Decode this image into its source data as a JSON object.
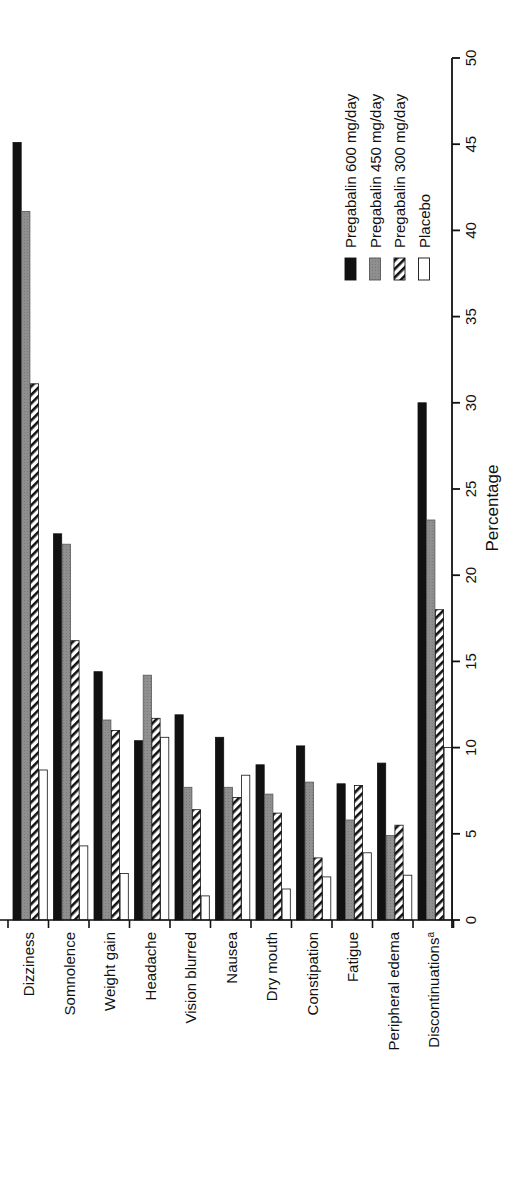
{
  "chart_data": {
    "type": "bar",
    "orientation": "rotated 90 degrees counter-clockwise (grouped vertical bars, value axis on right)",
    "title": "",
    "xlabel": "",
    "ylabel": "Percentage",
    "ylim": [
      0,
      50
    ],
    "yticks": [
      0,
      5,
      10,
      15,
      20,
      25,
      30,
      35,
      40,
      45,
      50
    ],
    "grid": false,
    "legend_position": "upper right (top-right of rotated figure)",
    "categories": [
      "Dizziness",
      "Somnolence",
      "Weight gain",
      "Headache",
      "Vision blurred",
      "Nausea",
      "Dry mouth",
      "Constipation",
      "Fatigue",
      "Peripheral edema",
      "Discontinuations"
    ],
    "category_superscripts": {
      "Discontinuations": "a"
    },
    "series": [
      {
        "name": "Pregabalin 600 mg/day",
        "fill": "solid-black",
        "color": "#111111",
        "values": [
          45.1,
          22.4,
          14.4,
          10.4,
          11.9,
          10.6,
          9.0,
          10.1,
          7.9,
          9.1,
          30.0
        ]
      },
      {
        "name": "Pregabalin 450 mg/day",
        "fill": "gray",
        "color": "#8a8a8a",
        "values": [
          41.1,
          21.8,
          11.6,
          14.2,
          7.7,
          7.7,
          7.3,
          8.0,
          5.8,
          4.9,
          23.2
        ]
      },
      {
        "name": "Pregabalin 300 mg/day",
        "fill": "diagonal-hatch",
        "color": "#111111",
        "values": [
          31.1,
          16.2,
          11.0,
          11.7,
          6.4,
          7.1,
          6.2,
          3.6,
          7.8,
          5.5,
          18.0
        ]
      },
      {
        "name": "Placebo",
        "fill": "white-outline",
        "color": "#ffffff",
        "values": [
          8.7,
          4.3,
          2.7,
          10.6,
          1.4,
          8.4,
          1.8,
          2.5,
          3.9,
          2.6,
          10.0
        ]
      }
    ]
  },
  "axis": {
    "title": "Percentage",
    "ticks": [
      "0",
      "5",
      "10",
      "15",
      "20",
      "25",
      "30",
      "35",
      "40",
      "45",
      "50"
    ]
  },
  "categories": {
    "labels": [
      "Dizziness",
      "Somnolence",
      "Weight gain",
      "Headache",
      "Vision blurred",
      "Nausea",
      "Dry mouth",
      "Constipation",
      "Fatigue",
      "Peripheral edema",
      "Discontinuations"
    ],
    "superscript_last": "a"
  },
  "legend": {
    "items": [
      {
        "label": "Pregabalin 600 mg/day",
        "swatch": "solid-black"
      },
      {
        "label": "Pregabalin 450 mg/day",
        "swatch": "gray"
      },
      {
        "label": "Pregabalin 300 mg/day",
        "swatch": "diagonal-hatch"
      },
      {
        "label": "Placebo",
        "swatch": "white-outline"
      }
    ]
  },
  "colors": {
    "black": "#111111",
    "gray": "#8a8a8a",
    "axis": "#111111",
    "background": "#ffffff"
  }
}
